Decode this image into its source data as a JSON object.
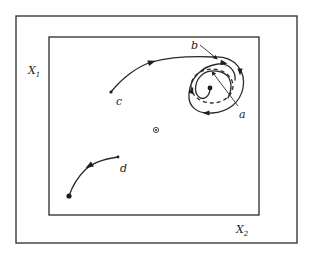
{
  "diagram": {
    "type": "phase-portrait",
    "outer_box": {
      "x": 16,
      "y": 16,
      "w": 281,
      "h": 227
    },
    "inner_box": {
      "x": 49,
      "y": 37,
      "w": 210,
      "h": 178
    },
    "axes": {
      "x1": {
        "label": "X",
        "subscript": "1",
        "x": 28,
        "y": 74
      },
      "x2": {
        "label": "X",
        "subscript": "2",
        "x": 236,
        "y": 233
      }
    },
    "equilibrium": {
      "x": 156,
      "y": 130,
      "symbol": "circled-dot"
    },
    "trajectories": [
      {
        "id": "c",
        "label": "c",
        "label_pos": {
          "x": 116,
          "y": 105
        },
        "path": "M111 92 C122 78 138 66 152 62 C170 57 190 56 214 57",
        "start": {
          "x": 111,
          "y": 92
        },
        "arrow": {
          "x": 152,
          "y": 62,
          "angle": -18
        }
      },
      {
        "id": "d",
        "label": "d",
        "label_pos": {
          "x": 120,
          "y": 172
        },
        "path": "M118 157 C104 159 92 163 85 170 C77 178 72 187 69 196",
        "start": {
          "x": 118,
          "y": 157
        },
        "end": {
          "x": 69,
          "y": 196
        },
        "arrow": {
          "x": 89,
          "y": 166,
          "angle": 150
        }
      }
    ],
    "limit_cycle": {
      "outer_spiral": "M214 57 C236 56 246 72 243 88 C240 103 228 112 212 113 C196 114 188 106 189 94 C190 78 202 66 218 64 C230 63 236 72 235 80",
      "dashed_cycle": {
        "cx": 212,
        "cy": 86,
        "rx": 21,
        "ry": 17
      },
      "inner_spiral": "M210 88 C210 96 204 101 199 97 C193 92 195 80 203 74 C210 69 224 70 229 78 C232 84 231 92 228 98",
      "inner_start": {
        "x": 210,
        "y": 88
      },
      "arrows": [
        {
          "x": 240,
          "y": 72,
          "angle": 90
        },
        {
          "x": 206,
          "y": 113,
          "angle": 180
        },
        {
          "x": 192,
          "y": 90,
          "angle": -70
        },
        {
          "x": 224,
          "y": 63,
          "angle": 10
        }
      ]
    },
    "annotations": [
      {
        "id": "a",
        "label": "a",
        "label_pos": {
          "x": 239,
          "y": 118
        },
        "leader": {
          "x1": 238,
          "y1": 106,
          "x2": 213,
          "y2": 73
        }
      },
      {
        "id": "b",
        "label": "b",
        "label_pos": {
          "x": 191,
          "y": 49
        },
        "leader": {
          "x1": 200,
          "y1": 45,
          "x2": 216,
          "y2": 58
        }
      }
    ],
    "colors": {
      "stroke": "#2a2a2a",
      "background": "#ffffff"
    }
  }
}
